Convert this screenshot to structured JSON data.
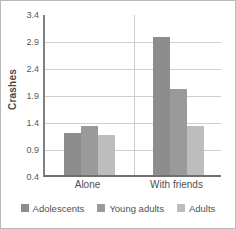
{
  "chart_data": {
    "type": "bar",
    "title": "",
    "xlabel": "",
    "ylabel": "Crashes",
    "categories": [
      "Alone",
      "With friends"
    ],
    "series": [
      {
        "name": "Adolescents",
        "color": "#8d8d8d",
        "values": [
          1.18,
          2.96
        ]
      },
      {
        "name": "Young adults",
        "color": "#9a9a9a",
        "values": [
          1.3,
          1.99
        ]
      },
      {
        "name": "Adults",
        "color": "#bdbdbd",
        "values": [
          1.14,
          1.3
        ]
      }
    ],
    "ylim": [
      0.4,
      3.4
    ],
    "yticks": [
      0.4,
      0.9,
      1.4,
      1.9,
      2.4,
      2.9,
      3.4
    ],
    "ytick_labels": [
      "0.4",
      "0.9",
      "1.4",
      "1.9",
      "2.4",
      "2.9",
      "3.4"
    ],
    "grid": "horizontal",
    "legend_position": "bottom",
    "annotations": []
  },
  "colors": {
    "grid": "#cfcfcf",
    "axis": "#808080",
    "text": "#4f4f4f",
    "border": "#b9b9b9",
    "background": "#ffffff"
  }
}
